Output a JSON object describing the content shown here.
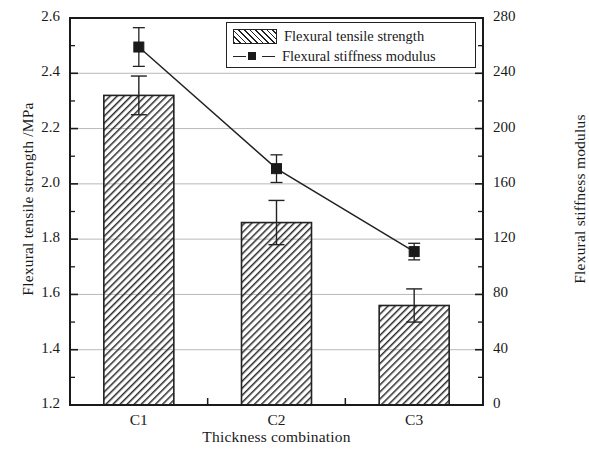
{
  "chart_data": {
    "type": "bar",
    "title": "",
    "xlabel": "Thickness combination",
    "ylabel": "Flexural tensile strength /MPa",
    "y2label": "Flexural stiffness modulus",
    "categories": [
      "C1",
      "C2",
      "C3"
    ],
    "ylim": [
      1.2,
      2.6
    ],
    "yticks": [
      "1.2",
      "1.4",
      "1.6",
      "1.8",
      "2.0",
      "2.2",
      "2.4",
      "2.6"
    ],
    "ytick_values": [
      1.2,
      1.4,
      1.6,
      1.8,
      2.0,
      2.2,
      2.4,
      2.6
    ],
    "y2lim": [
      0,
      280
    ],
    "y2ticks": [
      "0",
      "40",
      "80",
      "120",
      "160",
      "200",
      "240",
      "280"
    ],
    "y2tick_values": [
      0,
      40,
      80,
      120,
      160,
      200,
      240,
      280
    ],
    "grid": true,
    "legend_position": "top-right",
    "series": [
      {
        "name": "Flexural tensile strength",
        "kind": "bar",
        "axis": "left",
        "values": [
          2.32,
          1.86,
          1.56
        ],
        "errors": [
          0.07,
          0.08,
          0.06
        ],
        "fill": "hatch-45",
        "edge_color": "#222222"
      },
      {
        "name": "Flexural stiffness modulus",
        "kind": "line",
        "axis": "right",
        "values": [
          259,
          171,
          111
        ],
        "errors": [
          14,
          10,
          6
        ],
        "marker": "square-filled",
        "line_color": "#222222"
      }
    ]
  },
  "legend": {
    "items": [
      {
        "label": "Flexural tensile strength",
        "icon": "hatched-swatch"
      },
      {
        "label": "Flexural stiffness modulus",
        "icon": "line-square-marker"
      }
    ]
  }
}
